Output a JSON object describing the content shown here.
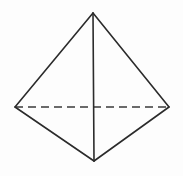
{
  "figure": {
    "name": "tetrahedron-wireframe",
    "canvas": {
      "width": 183,
      "height": 176,
      "background": "#fdfdfd"
    },
    "style": {
      "solid_edge_color": "#2b2b2b",
      "hidden_edge_color": "#3a3a3a",
      "solid_edge_width": 1.6,
      "hidden_edge_width": 1.7,
      "hidden_edge_dash": "8 5",
      "face_fill": "none"
    },
    "vertices": [
      {
        "id": "apex",
        "label": "apex",
        "x": 93,
        "y": 13
      },
      {
        "id": "left",
        "label": "left-back",
        "x": 15,
        "y": 107
      },
      {
        "id": "right",
        "label": "right-back",
        "x": 169,
        "y": 107
      },
      {
        "id": "front",
        "label": "front-bottom",
        "x": 94,
        "y": 161
      }
    ],
    "edges": [
      {
        "id": "apex-left",
        "from": "apex",
        "to": "left",
        "visible": true,
        "style": "solid"
      },
      {
        "id": "apex-right",
        "from": "apex",
        "to": "right",
        "visible": true,
        "style": "solid"
      },
      {
        "id": "apex-front",
        "from": "apex",
        "to": "front",
        "visible": true,
        "style": "solid"
      },
      {
        "id": "left-front",
        "from": "left",
        "to": "front",
        "visible": true,
        "style": "solid"
      },
      {
        "id": "right-front",
        "from": "right",
        "to": "front",
        "visible": true,
        "style": "solid"
      },
      {
        "id": "left-right",
        "from": "left",
        "to": "right",
        "visible": false,
        "style": "dashed"
      }
    ],
    "counts": {
      "vertices": 4,
      "edges": 6,
      "faces": 4,
      "hidden_edges": 1
    }
  }
}
